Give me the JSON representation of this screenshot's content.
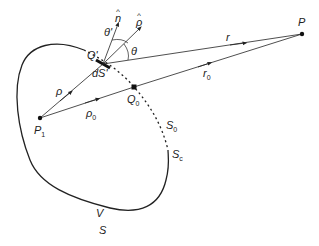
{
  "diagram": {
    "points": {
      "P": {
        "label": "P",
        "x": 302,
        "y": 34
      },
      "P1": {
        "label": "P",
        "sub": "1",
        "x": 40,
        "y": 118
      },
      "Q_prime": {
        "label": "Q'",
        "x": 103,
        "y": 64
      },
      "Q0": {
        "label": "Q",
        "sub": "0",
        "x": 134,
        "y": 87
      }
    },
    "vectors": {
      "r": {
        "label": "r"
      },
      "r0": {
        "label": "r",
        "sub": "0"
      },
      "rho": {
        "label": "ρ"
      },
      "rho0": {
        "label": "ρ",
        "sub": "0"
      },
      "n_hat": {
        "label": "n̂",
        "letter": "n",
        "hat": "^"
      },
      "p_hat": {
        "label": "ρ̂",
        "letter": "ρ",
        "hat": "^"
      }
    },
    "angles": {
      "theta_prime": "θ'",
      "theta": "θ"
    },
    "surface_labels": {
      "dS_prime": "dS'",
      "S0": {
        "label": "S",
        "sub": "0"
      },
      "Sc": {
        "label": "S",
        "sub": "c"
      },
      "V": "V",
      "S": "S"
    },
    "colors": {
      "stroke": "#222222",
      "background": "#ffffff"
    }
  }
}
